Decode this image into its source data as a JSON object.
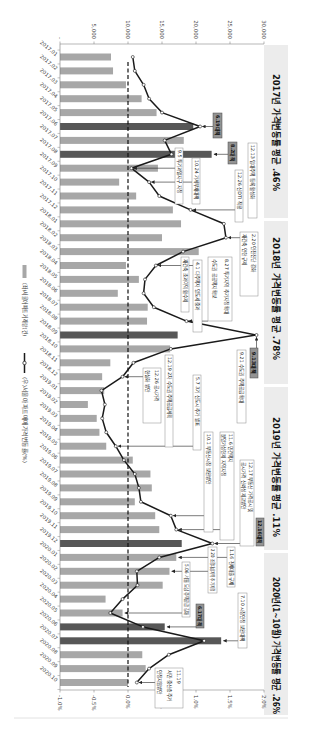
{
  "chart_data": {
    "type": "bar",
    "secondary_type": "line",
    "orientation": "rotated-90-clockwise",
    "title_segments": [
      "2017년 가격변동률 평균 .46%",
      "2018년 가격변동률 평균 .78%",
      "2019년 가격변동률 평균 .11%",
      "2020년(1~10월) 가격변동률 평균 .26%"
    ],
    "categories": [
      "2017.01",
      "2017.02",
      "2017.03",
      "2017.04",
      "2017.05",
      "2017.06",
      "2017.07",
      "2017.08",
      "2017.09",
      "2017.10",
      "2017.11",
      "2017.12",
      "2018.01",
      "2018.02",
      "2018.03",
      "2018.04",
      "2018.05",
      "2018.06",
      "2018.07",
      "2018.08",
      "2018.09",
      "2018.10",
      "2018.11",
      "2018.12",
      "2019.01",
      "2019.02",
      "2019.03",
      "2019.04",
      "2019.05",
      "2019.06",
      "2019.07",
      "2019.08",
      "2019.09",
      "2019.10",
      "2019.11",
      "2019.12",
      "2020.01",
      "2020.02",
      "2020.03",
      "2020.04",
      "2020.05",
      "2020.06",
      "2020.07",
      "2020.08",
      "2020.09",
      "2020.10"
    ],
    "series": [
      {
        "name": "(좌)서울아파트거래량(건)",
        "type": "bar",
        "axis": "left",
        "values": [
          7500,
          7800,
          9700,
          12000,
          14200,
          19600,
          18200,
          22300,
          14400,
          8700,
          11200,
          16600,
          17800,
          15000,
          20400,
          9700,
          11600,
          8500,
          12900,
          12800,
          17300,
          16200,
          7400,
          6200,
          6500,
          4100,
          5400,
          5800,
          6800,
          10700,
          13300,
          13500,
          11000,
          14000,
          14600,
          17900,
          17100,
          16100,
          15100,
          6700,
          9200,
          15400,
          23700,
          12100,
          12600,
          10000
        ],
        "highlighted_categories": [
          "2017.06",
          "2017.08",
          "2018.09",
          "2019.12",
          "2020.06",
          "2020.07"
        ]
      },
      {
        "name": "(우)서울아파트매매가격변동률(%)",
        "type": "line",
        "axis": "right",
        "values": [
          0.07,
          0.1,
          0.23,
          0.31,
          0.5,
          1.06,
          0.54,
          0.64,
          0.05,
          0.31,
          0.46,
          0.92,
          1.41,
          1.44,
          0.81,
          0.41,
          0.25,
          0.23,
          0.38,
          0.86,
          1.89,
          0.63,
          0.08,
          -0.08,
          -0.39,
          -0.34,
          -0.38,
          -0.32,
          -0.18,
          -0.06,
          0.1,
          0.16,
          0.19,
          0.63,
          0.71,
          1.24,
          0.46,
          0.13,
          0.14,
          -0.08,
          -0.26,
          0.22,
          1.12,
          0.6,
          0.31,
          0.13
        ]
      }
    ],
    "left_axis": {
      "ylim": [
        0,
        30000
      ],
      "ticks": [
        0,
        5000,
        10000,
        15000,
        20000,
        25000,
        30000
      ],
      "tick_labels": [
        "-",
        "5,000",
        "10,000",
        "15,000",
        "20,000",
        "25,000",
        "30,000"
      ]
    },
    "right_axis": {
      "ylim": [
        -1.0,
        2.0
      ],
      "ticks": [
        -1.0,
        -0.5,
        0.0,
        0.5,
        1.0,
        1.5,
        2.0
      ],
      "tick_labels": [
        "-1.0%",
        "-0.5%",
        "0.0%",
        "0.5%",
        "1.0%",
        "1.5%",
        "2.0%"
      ]
    },
    "reference_line": {
      "axis": "right",
      "value": 0.0,
      "style": "dashed"
    },
    "grid": false,
    "legend_position": "bottom",
    "legend": [
      {
        "label": "(좌)서울아파트거래량(건)",
        "marker": "bar"
      },
      {
        "label": "(우)서울아파트매매가격변동률(%)",
        "marker": "line-circle"
      }
    ],
    "annotations": [
      {
        "lines": [
          "6.19대책"
        ],
        "target": "2017.06",
        "target_series": "line",
        "style": "dark"
      },
      {
        "lines": [
          "8.2대책"
        ],
        "target": "2017.08",
        "target_series": "bar",
        "style": "dark"
      },
      {
        "lines": [
          "9.5 투기과열지구 지정"
        ],
        "target": "2017.09",
        "target_series": "line",
        "style": "box"
      },
      {
        "lines": [
          "10.24 가계부채대책"
        ],
        "target": "2017.10",
        "target_series": "line",
        "style": "box"
      },
      {
        "lines": [
          "12.13 임대주택 등록 활성화"
        ],
        "target": "2017.12",
        "target_series": "line",
        "style": "box"
      },
      {
        "lines": [
          "12.26 신DTI 적용"
        ],
        "target": "2017.12",
        "target_series": "line",
        "style": "box"
      },
      {
        "lines": [
          "2.20 안전진단 강화",
          "재건축 연한 규제"
        ],
        "target": "2018.02",
        "target_series": "line",
        "style": "box"
      },
      {
        "lines": [
          "4.1 다주택자 양도세 중과"
        ],
        "target": "2018.04",
        "target_series": "line",
        "style": "box"
      },
      {
        "lines": [
          "재건축 초과이익 환수제"
        ],
        "target": "2018.04",
        "target_series": "line",
        "style": "box"
      },
      {
        "lines": [
          "8.27 투기지역 추가지정 확대",
          "수도권 공공택지 확보"
        ],
        "target": "2018.08",
        "target_series": "line",
        "style": "box"
      },
      {
        "lines": [
          "9.13대책"
        ],
        "target": "2018.09",
        "target_series": "line",
        "style": "dark"
      },
      {
        "lines": [
          "9.21 수도권 주택공급 확대"
        ],
        "target": "2018.09",
        "target_series": "line",
        "style": "box"
      },
      {
        "lines": [
          "12.19 2차 수도권 주택공급계획"
        ],
        "target": "2018.12",
        "target_series": "line",
        "style": "box"
      },
      {
        "lines": [
          "12.26 공시가격",
          "현실화 방안"
        ],
        "target": "2018.12",
        "target_series": "line",
        "style": "box"
      },
      {
        "lines": [
          "5.7 3기 신도시 추가 발표"
        ],
        "target": "2019.05",
        "target_series": "line",
        "style": "box"
      },
      {
        "lines": [
          "10.1 부동산시장 보완방안"
        ],
        "target": "2019.10",
        "target_series": "line",
        "style": "box"
      },
      {
        "lines": [
          "11.6 민간택지",
          "분양가상한제 지역지정"
        ],
        "target": "2019.11",
        "target_series": "line",
        "style": "box"
      },
      {
        "lines": [
          "12.17 부동산 가격공시 및",
          "공시가격 신뢰성 제고방안"
        ],
        "target": "2019.12",
        "target_series": "line",
        "style": "box"
      },
      {
        "lines": [
          "12.16대책"
        ],
        "target": "2019.12",
        "target_series": "line",
        "style": "dark"
      },
      {
        "lines": [
          "1.16 전세대출 규제"
        ],
        "target": "2020.01",
        "target_series": "bar",
        "style": "box"
      },
      {
        "lines": [
          "2.20 조정대상지역 추가지정"
        ],
        "target": "2020.02",
        "target_series": "bar",
        "style": "box"
      },
      {
        "lines": [
          "5.06 서울 도심 주택공급 강화"
        ],
        "target": "2020.05",
        "target_series": "bar",
        "style": "box"
      },
      {
        "lines": [
          "6.17대책"
        ],
        "target": "2020.06",
        "target_series": "bar",
        "style": "dark"
      },
      {
        "lines": [
          "7.10 시장안정 보완대책"
        ],
        "target": "2020.07",
        "target_series": "bar",
        "style": "box"
      },
      {
        "lines": [
          "11.19",
          "서민·중산층 주거",
          "안정지원방안"
        ],
        "target": "2020.10",
        "target_series": "line",
        "style": "box"
      }
    ]
  },
  "colors": {
    "bar": "#a7a7a7",
    "bar_highlight": "#575757",
    "line": "#1a1a1a",
    "marker_fill": "#ffffff",
    "reference_line": "#111111",
    "dark_label": "#939393",
    "title_strip": "#ececec"
  }
}
